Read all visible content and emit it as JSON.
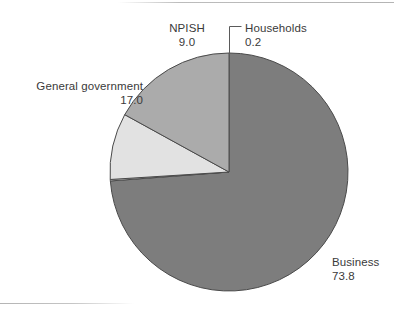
{
  "figure": {
    "background_color": "#ffffff",
    "frame_rule_color": "#bcbcbc"
  },
  "chart_data": {
    "type": "pie",
    "title": "",
    "subtitle": "",
    "xlabel": "",
    "ylabel": "",
    "legend_position": "none",
    "grid": false,
    "units": "percent",
    "total": 100.0,
    "start_angle_deg": 0,
    "direction": "clockwise",
    "categories": [
      "Business",
      "Households",
      "NPISH",
      "General government"
    ],
    "values": [
      73.8,
      0.2,
      9.0,
      17.0
    ],
    "value_labels": [
      "73.8",
      "0.2",
      "9.0",
      "17.0"
    ],
    "colors": [
      "#7d7d7d",
      "#f2f2f2",
      "#e2e2e2",
      "#ababab"
    ],
    "slice_edge_color": "#4a4a4a",
    "slices": [
      {
        "name": "Business",
        "label": "Business",
        "value_label": "73.8",
        "value": 73.8,
        "color": "#7d7d7d"
      },
      {
        "name": "Households",
        "label": "Households",
        "value_label": "0.2",
        "value": 0.2,
        "color": "#f2f2f2"
      },
      {
        "name": "NPISH",
        "label": "NPISH",
        "value_label": "9.0",
        "value": 9.0,
        "color": "#e2e2e2"
      },
      {
        "name": "General government",
        "label": "General government",
        "value_label": "17.0",
        "value": 17.0,
        "color": "#ababab"
      }
    ],
    "annotations": [
      {
        "name": "households-leader-line",
        "for": "Households",
        "type": "leader-line"
      }
    ]
  }
}
